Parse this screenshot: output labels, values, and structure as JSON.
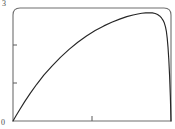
{
  "chart_data": {
    "type": "line",
    "title": "",
    "xlabel": "",
    "ylabel": "",
    "xlim": [
      0,
      1
    ],
    "ylim": [
      0,
      3
    ],
    "grid": false,
    "legend": null,
    "axis": {
      "y_tick_labels": [
        "0",
        "3"
      ],
      "y_ticks_labeled": [
        0,
        3
      ],
      "y_ticks_unlabeled": [
        1,
        2
      ],
      "x_tick_labels": [],
      "x_ticks_unlabeled": [
        0.5
      ],
      "frame": "box",
      "frame_color": "#6e6e6e"
    },
    "series": [
      {
        "name": "curve",
        "color": "#262626",
        "x": [
          0.0,
          0.02,
          0.045,
          0.075,
          0.11,
          0.15,
          0.195,
          0.245,
          0.3,
          0.355,
          0.41,
          0.465,
          0.52,
          0.575,
          0.625,
          0.675,
          0.72,
          0.76,
          0.79,
          0.815,
          0.84,
          0.862,
          0.882,
          0.9,
          0.915,
          0.928,
          0.94,
          0.95,
          0.958,
          0.965,
          0.971,
          0.976,
          0.981,
          0.986,
          0.991,
          0.996,
          1.0
        ],
        "y": [
          0.0,
          0.145,
          0.32,
          0.52,
          0.74,
          0.975,
          1.215,
          1.45,
          1.69,
          1.9,
          2.09,
          2.255,
          2.4,
          2.525,
          2.62,
          2.705,
          2.77,
          2.815,
          2.842,
          2.86,
          2.872,
          2.875,
          2.87,
          2.855,
          2.828,
          2.79,
          2.735,
          2.672,
          2.6,
          2.5,
          2.37,
          2.2,
          1.96,
          1.64,
          1.21,
          0.64,
          0.0
        ]
      }
    ]
  },
  "labels": {
    "y_max": "3",
    "y_min": "0"
  }
}
